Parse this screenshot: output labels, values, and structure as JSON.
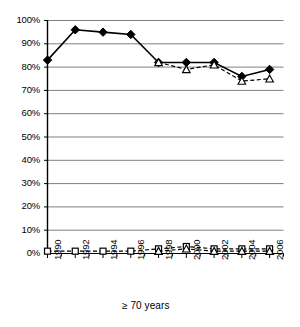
{
  "chart_data": {
    "type": "line",
    "title": "",
    "xlabel": "≥ 70 years",
    "ylabel": "",
    "x": [
      1990,
      1991,
      1992,
      1993,
      1994,
      1995,
      1996,
      1997,
      1998,
      1999,
      2000,
      2001,
      2002,
      2003,
      2004,
      2005,
      2006,
      2007
    ],
    "tick_x": [
      1990,
      1992,
      1994,
      1996,
      1998,
      2000,
      2002,
      2004,
      2006
    ],
    "xtick_labels": [
      "1990",
      "1992",
      "1994",
      "1996",
      "1998",
      "2000",
      "2002",
      "2004",
      "2006"
    ],
    "ytick_labels": [
      "0%",
      "10%",
      "20%",
      "30%",
      "40%",
      "50%",
      "60%",
      "70%",
      "80%",
      "90%",
      "100%"
    ],
    "ytick_values": [
      0,
      10,
      20,
      30,
      40,
      50,
      60,
      70,
      80,
      90,
      100
    ],
    "ylim": [
      0,
      100
    ],
    "xlim": [
      1990,
      2007
    ],
    "grid": "horizontal",
    "legend": "none",
    "series": [
      {
        "name": "filled-diamond-solid",
        "marker": "filled-diamond",
        "line": "solid",
        "color": "#000000",
        "x": [
          1990,
          1992,
          1994,
          1996,
          1998,
          2000,
          2002,
          2004,
          2006
        ],
        "values": [
          83,
          96,
          95,
          94,
          82,
          82,
          82,
          76,
          79
        ]
      },
      {
        "name": "open-triangle-dashed",
        "marker": "open-triangle",
        "line": "dashed",
        "color": "#000000",
        "x": [
          1998,
          2000,
          2002,
          2004,
          2006
        ],
        "values": [
          82,
          79,
          81,
          74,
          75
        ]
      },
      {
        "name": "open-square-dashed-baseline",
        "marker": "open-square",
        "line": "dashed",
        "color": "#000000",
        "x": [
          1990,
          1992,
          1994,
          1996,
          1998,
          2000,
          2002,
          2004,
          2006
        ],
        "values": [
          1,
          1,
          1,
          1,
          2,
          3,
          2,
          2,
          2
        ]
      },
      {
        "name": "open-triangle-dashed-baseline",
        "marker": "open-triangle",
        "line": "dashed",
        "color": "#000000",
        "x": [
          1998,
          2000,
          2002,
          2004,
          2006
        ],
        "values": [
          1,
          2,
          1,
          1,
          1
        ]
      }
    ],
    "colors": {
      "axis": "#000000",
      "grid": "#808080",
      "marker": "#000000",
      "background": "#ffffff"
    }
  }
}
